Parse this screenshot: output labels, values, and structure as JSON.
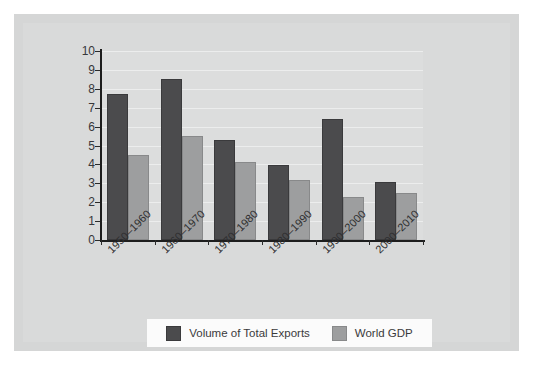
{
  "chart_data": {
    "type": "bar",
    "title": "",
    "subtitle": "",
    "xlabel": "",
    "ylabel": "",
    "categories": [
      "1950–1960",
      "1960–1970",
      "1970–1980",
      "1980–1990",
      "1990–2000",
      "2000–2010"
    ],
    "series": [
      {
        "name": "Volume of Total Exports",
        "color": "#4b4b4d",
        "values": [
          7.7,
          8.5,
          5.3,
          3.95,
          6.4,
          3.05
        ]
      },
      {
        "name": "World GDP",
        "color": "#9d9e9f",
        "values": [
          4.5,
          5.5,
          4.15,
          3.2,
          2.3,
          2.5
        ]
      }
    ],
    "ylim": [
      0,
      10
    ],
    "ytick_labels": [
      "10",
      "9",
      "8",
      "7",
      "6",
      "5",
      "4",
      "3",
      "2",
      "1",
      "0"
    ],
    "ytick_values": [
      10,
      9,
      8,
      7,
      6,
      5,
      4,
      3,
      2,
      1,
      0
    ],
    "grid": true,
    "grid_axis": "y",
    "legend_position": "bottom"
  },
  "legend": {
    "items": [
      {
        "label": "Volume of Total Exports",
        "swatch": "dark-swatch-icon"
      },
      {
        "label": "World GDP",
        "swatch": "light-swatch-icon"
      }
    ]
  },
  "colors": {
    "page_background": "#ffffff",
    "panel_background": "#d5d6d6",
    "plot_background": "#dcdddd",
    "gridline": "#eceded",
    "axis": "#1d1d1d",
    "series_dark": "#4b4b4d",
    "series_light": "#9d9e9f",
    "legend_background": "#fbfbfb",
    "text": "#2e2e30"
  }
}
